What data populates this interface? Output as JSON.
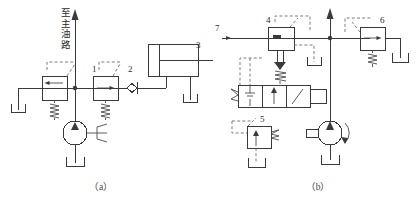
{
  "figure": {
    "title": "",
    "type": "hydraulic-circuit-schematic",
    "panels": [
      {
        "id": "a",
        "caption": "（a）",
        "annotation_text": "至主油路",
        "annotation_meaning": "to main oil circuit",
        "components": [
          {
            "ref": "",
            "name": "pilot-operated-relief-valve",
            "label": ""
          },
          {
            "ref": "1",
            "name": "unloading-valve",
            "label": "1"
          },
          {
            "ref": "2",
            "name": "check-valve",
            "label": "2"
          },
          {
            "ref": "3",
            "name": "hydraulic-cylinder",
            "label": "3"
          },
          {
            "ref": "",
            "name": "hydraulic-pump",
            "label": ""
          }
        ]
      },
      {
        "id": "b",
        "caption": "（b）",
        "components": [
          {
            "ref": "4",
            "name": "pilot-operated-relief-valve",
            "label": "4"
          },
          {
            "ref": "5",
            "name": "sequence-valve",
            "label": "5"
          },
          {
            "ref": "6",
            "name": "relief-valve",
            "label": "6"
          },
          {
            "ref": "7",
            "name": "supply-line-port",
            "label": "7"
          },
          {
            "ref": "",
            "name": "three-position-directional-valve",
            "label": ""
          },
          {
            "ref": "",
            "name": "hydraulic-pump",
            "label": ""
          }
        ]
      }
    ],
    "colors": {
      "line": "#3a3a3a",
      "dashed_pilot": "#6d6d6d",
      "background": "#ffffff",
      "text": "#2e2e2e"
    }
  },
  "labels": {
    "a_caption": "（a）",
    "b_caption": "（b）",
    "main_line_text": "至主油路",
    "n1": "1",
    "n2": "2",
    "n3": "3",
    "n4": "4",
    "n5": "5",
    "n6": "6",
    "n7": "7"
  }
}
